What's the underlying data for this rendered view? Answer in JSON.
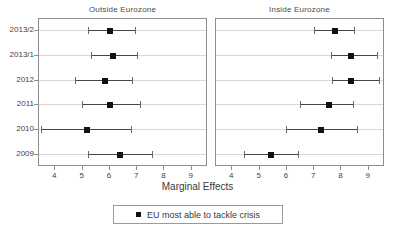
{
  "chart_data": {
    "type": "scatter",
    "title": "",
    "xlabel": "Marginal Effects",
    "ylabel": "",
    "xlim": [
      3.4,
      9.6
    ],
    "xticks": [
      4,
      5,
      6,
      7,
      8,
      9
    ],
    "xtick_labels": [
      "4",
      "5",
      "6",
      "7",
      "8",
      "9"
    ],
    "categories": [
      "2013/2",
      "2013/1",
      "2012",
      "2011",
      "2010",
      "2009"
    ],
    "grid": true,
    "legend_position": "bottom",
    "legend_entries": [
      "EU most able to tackle crisis"
    ],
    "panels": [
      {
        "name": "outside-eurozone",
        "title": "Outside Eurozone",
        "series_name": "EU most able to tackle crisis",
        "points": [
          {
            "category": "2013/2",
            "estimate": 6.05,
            "low": 5.25,
            "high": 6.95
          },
          {
            "category": "2013/1",
            "estimate": 6.15,
            "low": 5.35,
            "high": 7.05
          },
          {
            "category": "2012",
            "estimate": 5.85,
            "low": 4.75,
            "high": 6.85
          },
          {
            "category": "2011",
            "estimate": 6.05,
            "low": 5.0,
            "high": 7.15
          },
          {
            "category": "2010",
            "estimate": 5.2,
            "low": 3.5,
            "high": 6.8
          },
          {
            "category": "2009",
            "estimate": 6.4,
            "low": 5.25,
            "high": 7.6
          }
        ]
      },
      {
        "name": "inside-eurozone",
        "title": "Inside Eurozone",
        "series_name": "EU most able to tackle crisis",
        "points": [
          {
            "category": "2013/2",
            "estimate": 7.8,
            "low": 7.05,
            "high": 8.5
          },
          {
            "category": "2013/1",
            "estimate": 8.4,
            "low": 7.65,
            "high": 9.35
          },
          {
            "category": "2012",
            "estimate": 8.4,
            "low": 7.7,
            "high": 9.4
          },
          {
            "category": "2011",
            "estimate": 7.6,
            "low": 6.5,
            "high": 8.45
          },
          {
            "category": "2010",
            "estimate": 7.3,
            "low": 6.0,
            "high": 8.6
          },
          {
            "category": "2009",
            "estimate": 5.45,
            "low": 4.45,
            "high": 6.45
          }
        ]
      }
    ]
  },
  "legend": {
    "label": "EU most able to tackle crisis"
  },
  "axis": {
    "title": "Marginal Effects"
  },
  "colors": {
    "marker": "#111111",
    "ci_line": "#454545",
    "cap": "#6a6a6a",
    "grid": "#d8d8d8",
    "frame": "#8d8d8d",
    "text": "#3a3a3a",
    "background": "#ffffff"
  }
}
